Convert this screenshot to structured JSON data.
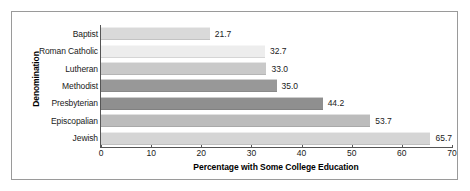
{
  "chart_data": {
    "type": "bar",
    "orientation": "horizontal",
    "title": "",
    "xlabel": "Percentage with Some College Education",
    "ylabel": "Denomination",
    "categories": [
      "Baptist",
      "Roman Catholic",
      "Lutheran",
      "Methodist",
      "Presbyterian",
      "Episcopalian",
      "Jewish"
    ],
    "values": [
      21.7,
      32.7,
      33.0,
      35.0,
      44.2,
      53.7,
      65.7
    ],
    "value_labels": [
      "21.7",
      "32.7",
      "33.0",
      "35.0",
      "44.2",
      "53.7",
      "65.7"
    ],
    "bar_colors": [
      "#d9d9d9",
      "#ededed",
      "#c9c9c9",
      "#989898",
      "#8f8f8f",
      "#bcbcbc",
      "#d5d5d5"
    ],
    "xlim": [
      0,
      70
    ],
    "xticks": [
      0,
      10,
      20,
      30,
      40,
      50,
      60,
      70
    ],
    "xtick_labels": [
      "0",
      "10",
      "20",
      "30",
      "40",
      "50",
      "60",
      "70"
    ],
    "grid": false,
    "legend": false
  },
  "frame": {
    "border_color": "#9a9a9a",
    "background": "#ffffff"
  }
}
